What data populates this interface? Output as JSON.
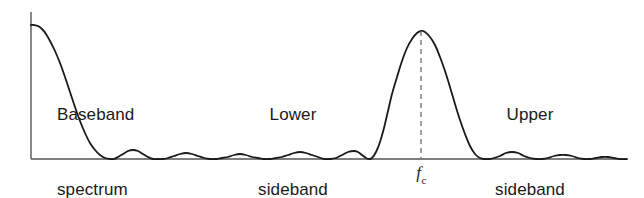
{
  "figure": {
    "background_color": "#ffffff",
    "curve_color": "#1a1a1a",
    "axis_color": "#555555",
    "dashed_line_color": "#777777"
  },
  "annotations": {
    "baseband": {
      "line1": "Baseband",
      "line2": "spectrum"
    },
    "lower": {
      "line1": "Lower",
      "line2": "sideband"
    },
    "upper": {
      "line1": "Upper",
      "line2": "sideband"
    },
    "carrier": {
      "symbol": "f",
      "subscript": "c"
    }
  },
  "chart_data": {
    "type": "line",
    "title": "",
    "xlabel": "",
    "ylabel": "",
    "grid": false,
    "legend": false,
    "axes": {
      "x_axis_visible": true,
      "y_axis_visible": true,
      "x_start_px": 31,
      "x_end_px": 627,
      "y_baseline_px": 159,
      "y_top_px": 12
    },
    "x_ticks": [
      {
        "label": "f_c",
        "display": "fc",
        "x_px": 421
      }
    ],
    "markers": [
      {
        "name": "carrier-frequency-line",
        "style": "dashed",
        "x_px": 421,
        "y_from_px": 31,
        "y_to_px": 159
      }
    ],
    "series": [
      {
        "name": "spectrum",
        "description": "Baseband sinc-type main lobe at DC with decaying sidelobes, plus a raised-cosine-like carrier lobe centred at fc with lower and upper sidebands and small trailing sidelobes.",
        "points": [
          [
            31,
            25
          ],
          [
            34,
            25
          ],
          [
            38,
            26
          ],
          [
            42,
            29
          ],
          [
            46,
            34
          ],
          [
            50,
            41
          ],
          [
            55,
            51
          ],
          [
            60,
            63
          ],
          [
            65,
            77
          ],
          [
            70,
            92
          ],
          [
            75,
            107
          ],
          [
            80,
            121
          ],
          [
            85,
            133
          ],
          [
            90,
            143
          ],
          [
            95,
            150
          ],
          [
            100,
            155
          ],
          [
            105,
            158
          ],
          [
            110,
            159
          ],
          [
            114,
            159
          ],
          [
            118,
            157
          ],
          [
            123,
            154
          ],
          [
            128,
            151
          ],
          [
            133,
            150
          ],
          [
            138,
            151
          ],
          [
            143,
            154
          ],
          [
            148,
            157
          ],
          [
            153,
            159
          ],
          [
            158,
            159
          ],
          [
            163,
            159
          ],
          [
            168,
            158
          ],
          [
            174,
            156
          ],
          [
            180,
            154
          ],
          [
            186,
            153
          ],
          [
            192,
            154
          ],
          [
            198,
            156
          ],
          [
            204,
            158
          ],
          [
            210,
            159
          ],
          [
            216,
            159
          ],
          [
            222,
            158
          ],
          [
            228,
            157
          ],
          [
            234,
            155
          ],
          [
            240,
            154
          ],
          [
            246,
            155
          ],
          [
            252,
            157
          ],
          [
            258,
            158
          ],
          [
            264,
            159
          ],
          [
            270,
            159
          ],
          [
            276,
            158
          ],
          [
            282,
            157
          ],
          [
            288,
            155
          ],
          [
            294,
            153
          ],
          [
            300,
            152
          ],
          [
            306,
            153
          ],
          [
            312,
            155
          ],
          [
            318,
            157
          ],
          [
            324,
            159
          ],
          [
            330,
            159
          ],
          [
            336,
            158
          ],
          [
            342,
            155
          ],
          [
            348,
            152
          ],
          [
            354,
            151
          ],
          [
            358,
            152
          ],
          [
            362,
            155
          ],
          [
            366,
            158
          ],
          [
            369,
            159
          ],
          [
            372,
            158
          ],
          [
            376,
            152
          ],
          [
            380,
            142
          ],
          [
            384,
            128
          ],
          [
            388,
            111
          ],
          [
            392,
            94
          ],
          [
            397,
            77
          ],
          [
            402,
            61
          ],
          [
            407,
            48
          ],
          [
            412,
            39
          ],
          [
            417,
            33
          ],
          [
            421,
            31
          ],
          [
            425,
            32
          ],
          [
            430,
            37
          ],
          [
            435,
            45
          ],
          [
            440,
            57
          ],
          [
            445,
            71
          ],
          [
            450,
            87
          ],
          [
            455,
            104
          ],
          [
            460,
            120
          ],
          [
            465,
            134
          ],
          [
            470,
            146
          ],
          [
            475,
            154
          ],
          [
            480,
            158
          ],
          [
            484,
            159
          ],
          [
            489,
            159
          ],
          [
            494,
            158
          ],
          [
            500,
            156
          ],
          [
            506,
            153
          ],
          [
            512,
            152
          ],
          [
            518,
            153
          ],
          [
            524,
            156
          ],
          [
            530,
            158
          ],
          [
            536,
            159
          ],
          [
            542,
            159
          ],
          [
            548,
            158
          ],
          [
            554,
            156
          ],
          [
            560,
            155
          ],
          [
            566,
            155
          ],
          [
            572,
            156
          ],
          [
            578,
            158
          ],
          [
            584,
            159
          ],
          [
            590,
            159
          ],
          [
            596,
            158
          ],
          [
            602,
            157
          ],
          [
            608,
            157
          ],
          [
            614,
            158
          ],
          [
            620,
            159
          ],
          [
            627,
            159
          ]
        ]
      }
    ]
  }
}
